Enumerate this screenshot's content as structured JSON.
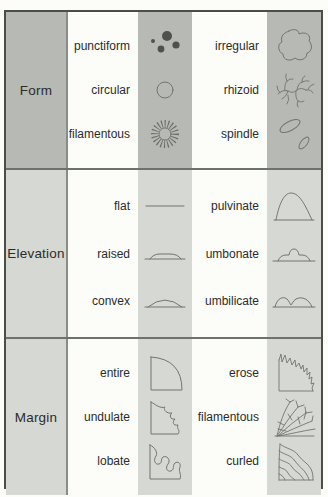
{
  "table": {
    "rows": [
      {
        "category": "Form",
        "left": [
          {
            "label": "punctiform",
            "icon": "punctiform-icon"
          },
          {
            "label": "circular",
            "icon": "circular-icon"
          },
          {
            "label": "filamentous",
            "icon": "filamentous-icon"
          }
        ],
        "right": [
          {
            "label": "irregular",
            "icon": "irregular-icon"
          },
          {
            "label": "rhizoid",
            "icon": "rhizoid-icon"
          },
          {
            "label": "spindle",
            "icon": "spindle-icon"
          }
        ]
      },
      {
        "category": "Elevation",
        "left": [
          {
            "label": "flat",
            "icon": "flat-icon"
          },
          {
            "label": "raised",
            "icon": "raised-icon"
          },
          {
            "label": "convex",
            "icon": "convex-icon"
          }
        ],
        "right": [
          {
            "label": "pulvinate",
            "icon": "pulvinate-icon"
          },
          {
            "label": "umbonate",
            "icon": "umbonate-icon"
          },
          {
            "label": "umbilicate",
            "icon": "umbilicate-icon"
          }
        ]
      },
      {
        "category": "Margin",
        "left": [
          {
            "label": "entire",
            "icon": "entire-icon"
          },
          {
            "label": "undulate",
            "icon": "undulate-icon"
          },
          {
            "label": "lobate",
            "icon": "lobate-icon"
          }
        ],
        "right": [
          {
            "label": "erose",
            "icon": "erose-icon"
          },
          {
            "label": "filamentous",
            "icon": "filamentous-margin-icon"
          },
          {
            "label": "curled",
            "icon": "curled-icon"
          }
        ]
      }
    ],
    "colors": {
      "shade_dark": "#b6b9b4",
      "shade_light": "#d5d8d3",
      "background": "#fcfcf9",
      "border": "#4b4d4a",
      "icon_stroke": "#72766f",
      "text": "#2b2c2a"
    }
  }
}
